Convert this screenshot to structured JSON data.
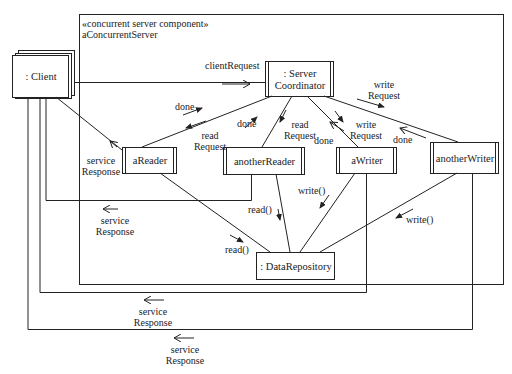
{
  "diagram": {
    "type": "UML communication diagram",
    "component": {
      "stereotype": "«concurrent server component»",
      "name": "aConcurrentServer"
    },
    "objects": {
      "client": ": Client",
      "server_coordinator_line1": ": Server",
      "server_coordinator_line2": "Coordinator",
      "a_reader": "aReader",
      "another_reader": "anotherReader",
      "a_writer": "aWriter",
      "another_writer": "anotherWriter",
      "data_repository": ": DataRepository"
    },
    "messages": {
      "client_request": "clientRequest",
      "done_areader": "done",
      "read_request_areader_1": "read",
      "read_request_areader_2": "Request",
      "done_anotherreader": "done",
      "read_request_anotherreader_1": "read",
      "read_request_anotherreader_2": "Request",
      "done_awriter": "done",
      "write_request_awriter_1": "write",
      "write_request_awriter_2": "Request",
      "write_request_anotherwriter_1": "write",
      "write_request_anotherwriter_2": "Request",
      "done_anotherwriter": "done",
      "service_response_areader_1": "service",
      "service_response_areader_2": "Response",
      "service_response_anotherreader_1": "service",
      "service_response_anotherreader_2": "Response",
      "service_response_awriter_1": "service",
      "service_response_awriter_2": "Response",
      "service_response_anotherwriter_1": "service",
      "service_response_anotherwriter_2": "Response",
      "read_areader": "read()",
      "read_anotherreader": "read()",
      "write_awriter": "write()",
      "write_anotherwriter": "write()"
    }
  }
}
